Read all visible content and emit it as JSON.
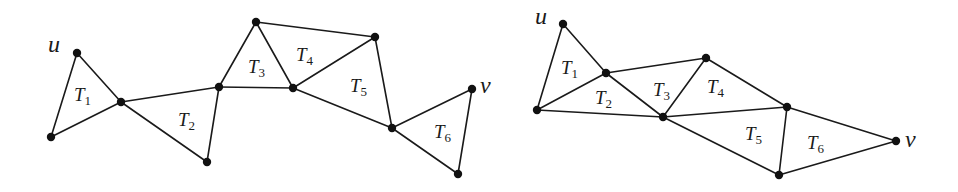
{
  "figure": {
    "colors": {
      "stroke": "#1a1a1a",
      "vertex": "#111111",
      "background": "#ffffff"
    }
  },
  "diagrams": [
    {
      "id": "left",
      "vertices": {
        "u": [
          77,
          53
        ],
        "p1": [
          51,
          137
        ],
        "h1": [
          121,
          102
        ],
        "p2": [
          207,
          162
        ],
        "h2": [
          219,
          87
        ],
        "p3": [
          256,
          22
        ],
        "h3": [
          293,
          88
        ],
        "p4": [
          375,
          37
        ],
        "h4": [
          392,
          128
        ],
        "v": [
          472,
          89
        ],
        "p6": [
          458,
          174
        ]
      },
      "edges": [
        [
          "u",
          "p1"
        ],
        [
          "u",
          "h1"
        ],
        [
          "p1",
          "h1"
        ],
        [
          "h1",
          "h2"
        ],
        [
          "h1",
          "p2"
        ],
        [
          "p2",
          "h2"
        ],
        [
          "h2",
          "p3"
        ],
        [
          "h2",
          "h3"
        ],
        [
          "p3",
          "h3"
        ],
        [
          "p3",
          "p4"
        ],
        [
          "h3",
          "p4"
        ],
        [
          "p4",
          "h4"
        ],
        [
          "h3",
          "h4"
        ],
        [
          "h4",
          "v"
        ],
        [
          "h4",
          "p6"
        ],
        [
          "v",
          "p6"
        ]
      ],
      "vertex_labels": [
        {
          "text": "u",
          "x": 48,
          "y": 52
        },
        {
          "text": "v",
          "x": 480,
          "y": 93
        }
      ],
      "triangle_labels": [
        {
          "text": "T",
          "sub": "1",
          "x": 74,
          "y": 101
        },
        {
          "text": "T",
          "sub": "2",
          "x": 178,
          "y": 126
        },
        {
          "text": "T",
          "sub": "3",
          "x": 248,
          "y": 73
        },
        {
          "text": "T",
          "sub": "4",
          "x": 296,
          "y": 61
        },
        {
          "text": "T",
          "sub": "5",
          "x": 350,
          "y": 92
        },
        {
          "text": "T",
          "sub": "6",
          "x": 434,
          "y": 138
        }
      ]
    },
    {
      "id": "right",
      "vertices": {
        "u": [
          563,
          24
        ],
        "a": [
          537,
          110
        ],
        "b": [
          606,
          73
        ],
        "c": [
          706,
          58
        ],
        "d": [
          663,
          117
        ],
        "e": [
          787,
          107
        ],
        "f": [
          779,
          175
        ],
        "v": [
          896,
          141
        ]
      },
      "edges": [
        [
          "u",
          "a"
        ],
        [
          "u",
          "b"
        ],
        [
          "a",
          "b"
        ],
        [
          "a",
          "d"
        ],
        [
          "b",
          "d"
        ],
        [
          "b",
          "c"
        ],
        [
          "c",
          "d"
        ],
        [
          "c",
          "e"
        ],
        [
          "d",
          "e"
        ],
        [
          "d",
          "f"
        ],
        [
          "e",
          "f"
        ],
        [
          "e",
          "v"
        ],
        [
          "f",
          "v"
        ]
      ],
      "vertex_labels": [
        {
          "text": "u",
          "x": 535,
          "y": 24
        },
        {
          "text": "v",
          "x": 905,
          "y": 147
        }
      ],
      "triangle_labels": [
        {
          "text": "T",
          "sub": "1",
          "x": 561,
          "y": 74
        },
        {
          "text": "T",
          "sub": "2",
          "x": 595,
          "y": 104
        },
        {
          "text": "T",
          "sub": "3",
          "x": 653,
          "y": 96
        },
        {
          "text": "T",
          "sub": "4",
          "x": 707,
          "y": 93
        },
        {
          "text": "T",
          "sub": "5",
          "x": 745,
          "y": 140
        },
        {
          "text": "T",
          "sub": "6",
          "x": 807,
          "y": 149
        }
      ]
    }
  ]
}
